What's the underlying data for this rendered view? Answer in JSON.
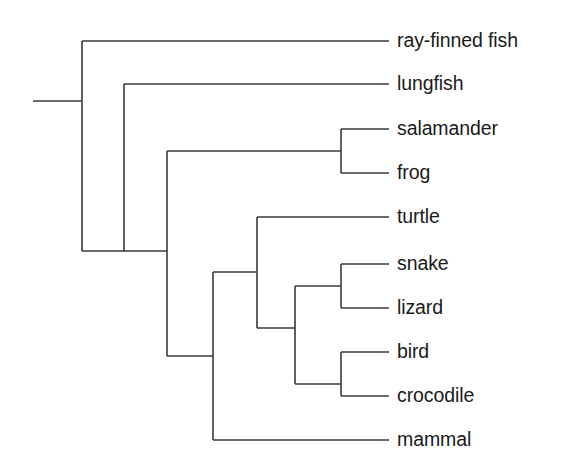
{
  "figure": {
    "kind": "cladogram",
    "background_color": "#ffffff",
    "line_color": "#3a3a3a",
    "line_width": 1.6,
    "label_color": "#1a1a1a"
  },
  "tips": [
    {
      "id": "ray-finned-fish",
      "label": "ray-finned fish",
      "x_start": 82,
      "x_end": 389,
      "y": 41,
      "label_x": 397
    },
    {
      "id": "lungfish",
      "label": "lungfish",
      "x_start": 124,
      "x_end": 389,
      "y": 84,
      "label_x": 397
    },
    {
      "id": "salamander",
      "label": "salamander",
      "x_start": 341,
      "x_end": 389,
      "y": 129,
      "label_x": 397
    },
    {
      "id": "frog",
      "label": "frog",
      "x_start": 341,
      "x_end": 389,
      "y": 173,
      "label_x": 397
    },
    {
      "id": "turtle",
      "label": "turtle",
      "x_start": 257,
      "x_end": 389,
      "y": 217,
      "label_x": 397
    },
    {
      "id": "snake",
      "label": "snake",
      "x_start": 341,
      "x_end": 389,
      "y": 264,
      "label_x": 397
    },
    {
      "id": "lizard",
      "label": "lizard",
      "x_start": 341,
      "x_end": 389,
      "y": 308,
      "label_x": 397
    },
    {
      "id": "bird",
      "label": "bird",
      "x_start": 341,
      "x_end": 389,
      "y": 352,
      "label_x": 397
    },
    {
      "id": "crocodile",
      "label": "crocodile",
      "x_start": 341,
      "x_end": 389,
      "y": 396,
      "label_x": 397
    },
    {
      "id": "mammal",
      "label": "mammal",
      "x_start": 213,
      "x_end": 389,
      "y": 440,
      "label_x": 397
    }
  ],
  "root_stem": {
    "id": "root-stem",
    "x_start": 33,
    "x_end": 82,
    "y": 101
  },
  "internal_nodes": [
    {
      "id": "node-vertebrata",
      "x": 82,
      "y_top": 41,
      "y_bottom": 251,
      "parent_y": 101
    },
    {
      "id": "node-sarcopterygii",
      "x": 124,
      "y_top": 84,
      "y_bottom": 251,
      "parent_y": 251,
      "connector_x_start": 82,
      "connector_x_end": 124
    },
    {
      "id": "node-tetrapoda",
      "x": 167,
      "y_top": 151,
      "y_bottom": 356,
      "parent_y": 251,
      "connector_x_start": 124,
      "connector_x_end": 167
    },
    {
      "id": "node-amphibia",
      "x": 341,
      "y_top": 129,
      "y_bottom": 173,
      "parent_y": 151,
      "connector_x_start": 167,
      "connector_x_end": 341
    },
    {
      "id": "node-amniota",
      "x": 213,
      "y_top": 272,
      "y_bottom": 440,
      "parent_y": 356,
      "connector_x_start": 167,
      "connector_x_end": 213
    },
    {
      "id": "node-reptilia",
      "x": 257,
      "y_top": 217,
      "y_bottom": 328,
      "parent_y": 272,
      "connector_x_start": 213,
      "connector_x_end": 257
    },
    {
      "id": "node-diapsid",
      "x": 295,
      "y_top": 286,
      "y_bottom": 384,
      "parent_y": 328,
      "connector_x_start": 257,
      "connector_x_end": 295
    },
    {
      "id": "node-squamata",
      "x": 341,
      "y_top": 264,
      "y_bottom": 308,
      "parent_y": 286,
      "connector_x_start": 295,
      "connector_x_end": 341
    },
    {
      "id": "node-archosauria",
      "x": 341,
      "y_top": 352,
      "y_bottom": 396,
      "parent_y": 384,
      "connector_x_start": 295,
      "connector_x_end": 341
    }
  ]
}
